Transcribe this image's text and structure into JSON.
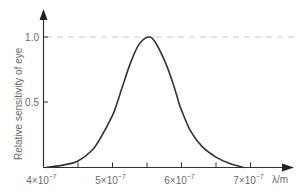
{
  "chart_data": {
    "type": "line",
    "title": "",
    "xlabel": "λ/m",
    "ylabel": "Relative sensitivity of eye",
    "xlim": [
      4e-07,
      7.55e-07
    ],
    "ylim": [
      0,
      1.2
    ],
    "grid": false,
    "legend": null,
    "x_ticks": [
      {
        "value": 4e-07,
        "label_mantissa": "4",
        "label_exp": "-7",
        "major": true
      },
      {
        "value": 4.5e-07,
        "major": false
      },
      {
        "value": 5e-07,
        "label_mantissa": "5",
        "label_exp": "-7",
        "major": true
      },
      {
        "value": 5.5e-07,
        "major": false
      },
      {
        "value": 6e-07,
        "label_mantissa": "6",
        "label_exp": "-7",
        "major": true
      },
      {
        "value": 6.5e-07,
        "major": false
      },
      {
        "value": 7e-07,
        "label_mantissa": "7",
        "label_exp": "-7",
        "major": true
      }
    ],
    "y_ticks": [
      {
        "value": 0.5,
        "label": "0.5"
      },
      {
        "value": 1.0,
        "label": "1.0"
      }
    ],
    "reference_line": {
      "y": 1.0,
      "style": "dashed",
      "color": "#c8c8c8"
    },
    "series": [
      {
        "name": "Relative sensitivity",
        "color": "#333333",
        "x": [
          4.03e-07,
          4.3e-07,
          4.5e-07,
          4.7e-07,
          4.83e-07,
          5e-07,
          5.07e-07,
          5.15e-07,
          5.26e-07,
          5.38e-07,
          5.52e-07,
          5.62e-07,
          5.77e-07,
          5.88e-07,
          5.96e-07,
          6e-07,
          6.13e-07,
          6.3e-07,
          6.5e-07,
          6.7e-07,
          6.9e-07
        ],
        "values": [
          0.0,
          0.02,
          0.05,
          0.13,
          0.23,
          0.4,
          0.5,
          0.63,
          0.8,
          0.94,
          1.0,
          0.96,
          0.8,
          0.64,
          0.5,
          0.44,
          0.28,
          0.16,
          0.08,
          0.03,
          0.0
        ]
      }
    ]
  },
  "labels": {
    "ylabel": "Relative sensitivity of eye",
    "xlabel": "λ/m",
    "y_tick_1": "1.0",
    "y_tick_05": "0.5",
    "x_times": "×10",
    "x_exp": "−7"
  },
  "colors": {
    "axis": "#333333",
    "curve": "#333333",
    "dashed": "#c8c8c8",
    "text": "#6a6a6a"
  }
}
